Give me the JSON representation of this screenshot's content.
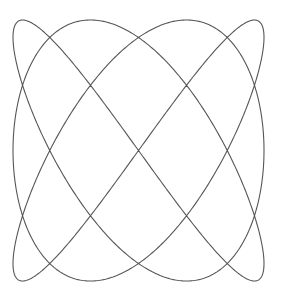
{
  "chart_data": {
    "type": "line",
    "title": "",
    "xlabel": "",
    "ylabel": "",
    "grid": false,
    "legend": null,
    "params": {
      "x_freq": 3,
      "y_freq": 4,
      "x_phase": 1.5707963,
      "y_phase": 0,
      "samples": 1200
    },
    "pixel_bounds": {
      "x_min": 13,
      "x_max": 264,
      "y_min": 20,
      "y_max": 281
    },
    "xlim": [
      -1,
      1
    ],
    "ylim": [
      -1,
      1
    ],
    "line_color": "#555555"
  }
}
